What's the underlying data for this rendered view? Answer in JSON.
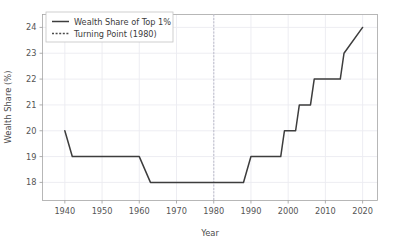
{
  "chart_data": {
    "type": "line",
    "title": "",
    "xlabel": "Year",
    "ylabel": "Wealth Share (%)",
    "xlim": [
      1934,
      2024
    ],
    "ylim": [
      17.3,
      24.5
    ],
    "grid": true,
    "legend_position": "upper-left",
    "xticks": [
      1940,
      1950,
      1960,
      1970,
      1980,
      1990,
      2000,
      2010,
      2020
    ],
    "xtick_labels": [
      "1940",
      "1950",
      "1960",
      "1970",
      "1980",
      "1990",
      "2000",
      "2010",
      "2020"
    ],
    "yticks": [
      18,
      19,
      20,
      21,
      22,
      23,
      24
    ],
    "ytick_labels": [
      "18",
      "19",
      "20",
      "21",
      "22",
      "23",
      "24"
    ],
    "series": [
      {
        "name": "Wealth Share of Top 1%",
        "color": "#3d3d3d",
        "linestyle": "solid",
        "x": [
          1940,
          1942,
          1960,
          1963,
          1988,
          1990,
          1998,
          1999,
          2002,
          2003,
          2006,
          2007,
          2014,
          2015,
          2020
        ],
        "values": [
          20,
          19,
          19,
          18,
          18,
          19,
          19,
          20,
          20,
          21,
          21,
          22,
          22,
          23,
          24
        ]
      }
    ],
    "annotations": [
      {
        "name": "Turning Point (1980)",
        "type": "vline",
        "x": 1980,
        "color": "#c9c9d4",
        "linestyle": "dotted"
      }
    ],
    "legend_entries": [
      {
        "label": "Wealth Share of Top 1%",
        "linestyle": "solid",
        "color": "#3d3d3d"
      },
      {
        "label": "Turning Point (1980)",
        "linestyle": "dotted",
        "color": "#4a4a4a"
      }
    ]
  },
  "figure": {
    "background": "#ffffff",
    "grid_color": "#ebebf0",
    "axis_color": "#9a9a9a"
  }
}
